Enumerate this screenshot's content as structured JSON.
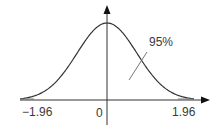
{
  "chart_data": {
    "type": "line",
    "curve": "standard normal density",
    "x_ticks": [
      {
        "value": -1.96,
        "label": "−1.96"
      },
      {
        "value": 0,
        "label": "0"
      },
      {
        "value": 1.96,
        "label": "1.96"
      }
    ],
    "annotation": {
      "text": "95%",
      "meaning": "area under curve between −1.96 and 1.96"
    },
    "xlabel": "",
    "ylabel": "",
    "grid": false,
    "legend": null
  },
  "labels": {
    "left_tick": "−1.96",
    "center_tick": "0",
    "right_tick": "1.96",
    "area_label": "95%"
  },
  "colors": {
    "line": "#333333",
    "text": "#3a3a3a",
    "leader": "#666666"
  }
}
